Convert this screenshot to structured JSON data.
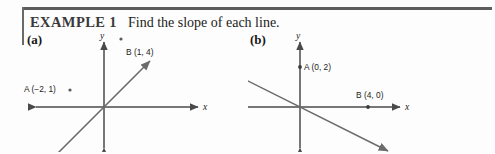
{
  "header": {
    "example_label": "EXAMPLE 1",
    "prompt": "Find the slope of each line."
  },
  "parts": [
    {
      "id": "a",
      "label": "(a)",
      "axes": {
        "x_label": "x",
        "y_label": "y"
      },
      "points": [
        {
          "name": "A",
          "coords": "(−2, 1)",
          "label": "A (−2, 1)",
          "x": -2,
          "y": 1
        },
        {
          "name": "B",
          "coords": "(1, 4)",
          "label": "B (1, 4)",
          "x": 1,
          "y": 4
        }
      ],
      "line": {
        "slope": 1,
        "intercept": 3,
        "direction": "increasing"
      }
    },
    {
      "id": "b",
      "label": "(b)",
      "axes": {
        "x_label": "x",
        "y_label": "y"
      },
      "points": [
        {
          "name": "A",
          "coords": "(0, 2)",
          "label": "A (0, 2)",
          "x": 0,
          "y": 2
        },
        {
          "name": "B",
          "coords": "(4, 0)",
          "label": "B (4, 0)",
          "x": 4,
          "y": 0
        }
      ],
      "line": {
        "slope": -0.5,
        "intercept": 2,
        "direction": "decreasing"
      }
    }
  ],
  "colors": {
    "rule": "#5d5d5d",
    "axis": "#4a4a4a",
    "line": "#6b6b6b",
    "text": "#1b1b1b"
  }
}
